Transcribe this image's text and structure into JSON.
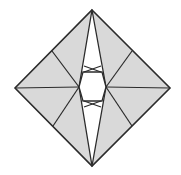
{
  "diagram": {
    "type": "origami-crease-pattern",
    "colors": {
      "background": "#ffffff",
      "paper": "#d9d9d9",
      "opening": "#ffffff",
      "line": "#2b2b2b"
    },
    "outline": {
      "top": [
        92,
        10
      ],
      "right": [
        170,
        88
      ],
      "bottom": [
        92,
        166
      ],
      "left": [
        15,
        88
      ]
    },
    "spindle": {
      "top": [
        92,
        10
      ],
      "bottom": [
        92,
        166
      ],
      "left_mid": [
        79,
        87
      ],
      "right_mid": [
        106,
        87
      ]
    },
    "opening": {
      "points": [
        [
          83,
          72
        ],
        [
          102,
          72
        ],
        [
          106,
          87
        ],
        [
          102,
          101
        ],
        [
          83,
          101
        ],
        [
          79,
          87
        ]
      ]
    },
    "creases": [
      {
        "from": [
          15,
          88
        ],
        "to": [
          79,
          87
        ]
      },
      {
        "from": [
          170,
          88
        ],
        "to": [
          106,
          87
        ]
      },
      {
        "from": [
          52,
          51
        ],
        "to": [
          79,
          87
        ]
      },
      {
        "from": [
          53,
          126
        ],
        "to": [
          79,
          87
        ]
      },
      {
        "from": [
          132,
          51
        ],
        "to": [
          106,
          87
        ]
      },
      {
        "from": [
          132,
          126
        ],
        "to": [
          106,
          87
        ]
      },
      {
        "from": [
          84,
          66
        ],
        "to": [
          101,
          72
        ]
      },
      {
        "from": [
          101,
          66
        ],
        "to": [
          84,
          72
        ]
      },
      {
        "from": [
          84,
          107
        ],
        "to": [
          101,
          101
        ]
      },
      {
        "from": [
          101,
          107
        ],
        "to": [
          84,
          101
        ]
      }
    ]
  }
}
